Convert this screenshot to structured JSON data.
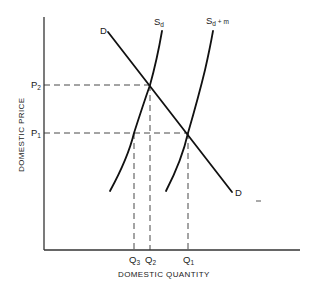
{
  "diagram": {
    "type": "supply-demand",
    "axes": {
      "x_label": "DOMESTIC QUANTITY",
      "y_label": "DOMESTIC PRICE"
    },
    "curves": {
      "demand": {
        "label": "D",
        "end_label": "D"
      },
      "domestic_supply": {
        "label": "S",
        "subscript": "d"
      },
      "total_supply": {
        "label": "S",
        "subscript": "d",
        "suffix": " + m"
      }
    },
    "price_levels": [
      {
        "label": "P",
        "subscript": "2"
      },
      {
        "label": "P",
        "subscript": "1"
      }
    ],
    "quantity_levels": [
      {
        "label": "Q",
        "subscript": "3"
      },
      {
        "label": "Q",
        "subscript": "2"
      },
      {
        "label": "Q",
        "subscript": "1"
      }
    ],
    "colors": {
      "line": "#111111",
      "axis": "#333333",
      "background": "#ffffff"
    }
  }
}
